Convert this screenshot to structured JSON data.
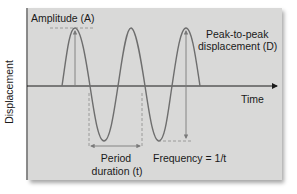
{
  "diagram": {
    "type": "sine-wave-annotation",
    "y_axis_label": "Displacement",
    "x_axis_label": "Time",
    "annotations": {
      "amplitude": "Amplitude (A)",
      "peak_to_peak_line1": "Peak-to-peak",
      "peak_to_peak_line2": "displacement (D)",
      "period_line1": "Period",
      "period_line2": "duration (t)",
      "frequency": "Frequency = 1/t"
    },
    "colors": {
      "panel": "#d9d9d8",
      "wave": "#6e6e6e",
      "axis": "#1a1a1a",
      "dashed": "#8a8a8a"
    }
  }
}
